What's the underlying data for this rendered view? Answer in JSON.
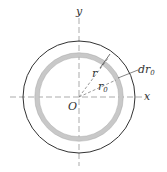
{
  "diagram": {
    "labels": {
      "y_axis": "y",
      "x_axis": "x",
      "origin": "O",
      "r": "r",
      "r0": "r",
      "r0_sub": "0",
      "dr0": "dr",
      "dr0_sub": "0"
    },
    "colors": {
      "ring": "#c8c8c8",
      "line": "#333333",
      "axis": "#888888"
    }
  }
}
